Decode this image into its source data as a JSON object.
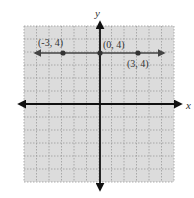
{
  "chart_data": {
    "type": "line",
    "title": "",
    "xlabel": "x",
    "ylabel": "y",
    "xlim": [
      -6,
      6
    ],
    "ylim": [
      -6,
      6
    ],
    "grid": true,
    "grid_style": "dotted",
    "series": [
      {
        "name": "y = 4",
        "kind": "horizontal line with arrows",
        "x": [
          -6,
          6
        ],
        "y": [
          4,
          4
        ],
        "color": "#444444"
      }
    ],
    "points": [
      {
        "x": -3,
        "y": 4,
        "label": "(-3, 4)"
      },
      {
        "x": 0,
        "y": 4,
        "label": "(0, 4)"
      },
      {
        "x": 3,
        "y": 4,
        "label": "(3, 4)"
      }
    ]
  },
  "labels": {
    "x_axis": "x",
    "y_axis": "y",
    "p1": "(-3, 4)",
    "p2": "(0, 4)",
    "p3": "(3, 4)"
  },
  "colors": {
    "grid_bg": "#dcdcdc",
    "grid_line": "#9a9a9a",
    "axis": "#111111",
    "line": "#444444",
    "point": "#333333"
  }
}
